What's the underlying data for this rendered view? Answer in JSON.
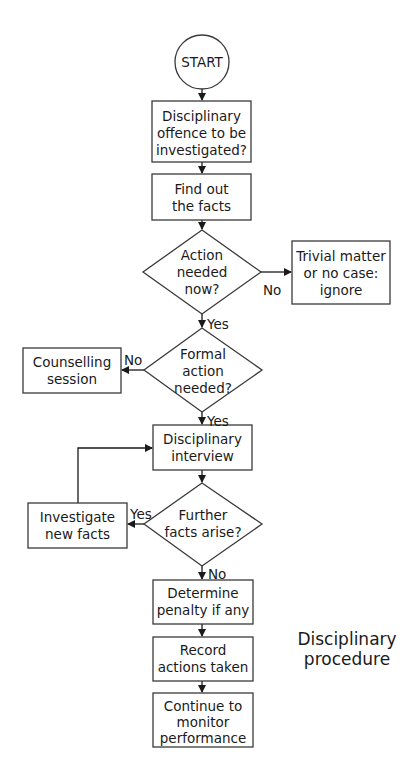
{
  "diagram": {
    "type": "flowchart",
    "caption": [
      "Disciplinary",
      "procedure"
    ],
    "nodes": {
      "start": {
        "shape": "circle",
        "lines": [
          "START"
        ]
      },
      "offence": {
        "shape": "rect",
        "lines": [
          "Disciplinary",
          "offence to be",
          "investigated?"
        ]
      },
      "facts": {
        "shape": "rect",
        "lines": [
          "Find out",
          "the facts"
        ]
      },
      "action_now": {
        "shape": "diamond",
        "lines": [
          "Action",
          "needed",
          "now?"
        ]
      },
      "trivial": {
        "shape": "rect",
        "lines": [
          "Trivial matter",
          "or no case:",
          "ignore"
        ]
      },
      "formal": {
        "shape": "diamond",
        "lines": [
          "Formal",
          "action",
          "needed?"
        ]
      },
      "counselling": {
        "shape": "rect",
        "lines": [
          "Counselling",
          "session"
        ]
      },
      "interview": {
        "shape": "rect",
        "lines": [
          "Disciplinary",
          "interview"
        ]
      },
      "further": {
        "shape": "diamond",
        "lines": [
          "Further",
          "facts arise?"
        ]
      },
      "investigate": {
        "shape": "rect",
        "lines": [
          "Investigate",
          "new facts"
        ]
      },
      "penalty": {
        "shape": "rect",
        "lines": [
          "Determine",
          "penalty if any"
        ]
      },
      "record": {
        "shape": "rect",
        "lines": [
          "Record",
          "actions taken"
        ]
      },
      "monitor": {
        "shape": "rect",
        "lines": [
          "Continue to",
          "monitor",
          "performance"
        ]
      }
    },
    "edges": [
      {
        "from": "start",
        "to": "offence",
        "label": ""
      },
      {
        "from": "offence",
        "to": "facts",
        "label": ""
      },
      {
        "from": "facts",
        "to": "action_now",
        "label": ""
      },
      {
        "from": "action_now",
        "to": "trivial",
        "label": "No"
      },
      {
        "from": "action_now",
        "to": "formal",
        "label": "Yes"
      },
      {
        "from": "formal",
        "to": "counselling",
        "label": "No"
      },
      {
        "from": "formal",
        "to": "interview",
        "label": "Yes"
      },
      {
        "from": "interview",
        "to": "further",
        "label": ""
      },
      {
        "from": "further",
        "to": "investigate",
        "label": "Yes"
      },
      {
        "from": "investigate",
        "to": "interview",
        "label": ""
      },
      {
        "from": "further",
        "to": "penalty",
        "label": "No"
      },
      {
        "from": "penalty",
        "to": "record",
        "label": ""
      },
      {
        "from": "record",
        "to": "monitor",
        "label": ""
      }
    ],
    "labels": {
      "action_now_no": "No",
      "action_now_yes": "Yes",
      "formal_no": "No",
      "formal_yes": "Yes",
      "further_yes": "Yes",
      "further_no": "No"
    }
  }
}
